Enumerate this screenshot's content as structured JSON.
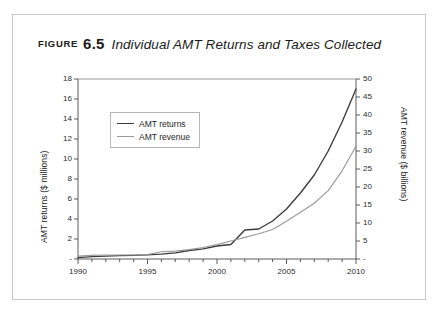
{
  "figure": {
    "kicker": "Figure",
    "number": "6.5",
    "title": "Individual AMT Returns and Taxes Collected"
  },
  "colors": {
    "returns_line": "#3b3b3b",
    "revenue_line": "#9a9a9a",
    "axis": "#4a4a4a",
    "frame": "#c9c9c9",
    "text": "#1b1b1b"
  },
  "legend": {
    "position": "top-left-inside",
    "items": [
      {
        "label": "AMT returns",
        "color": "#3b3b3b"
      },
      {
        "label": "AMT revenue",
        "color": "#9a9a9a"
      }
    ]
  },
  "chart_data": {
    "type": "line",
    "title": "Individual AMT Returns and Taxes Collected",
    "xlabel": "",
    "ylabel": "AMT returns ($ millions)",
    "y2label": "AMT revenue ($ billions)",
    "grid": false,
    "xlim": [
      1990,
      2010
    ],
    "ylim": [
      0,
      18
    ],
    "y2lim": [
      0,
      50
    ],
    "xticks": [
      1990,
      1995,
      2000,
      2005,
      2010
    ],
    "xticklabels": [
      "1990",
      "1995",
      "2000",
      "2005",
      "2010"
    ],
    "xminorticks_every": 1,
    "yticks": [
      0,
      2,
      4,
      6,
      8,
      10,
      12,
      14,
      16,
      18
    ],
    "yticklabels": [
      "-",
      "2",
      "4",
      "6",
      "8",
      "10",
      "12",
      "14",
      "16",
      "18"
    ],
    "y2ticks": [
      0,
      5,
      10,
      15,
      20,
      25,
      30,
      35,
      40,
      45,
      50
    ],
    "y2ticklabels": [
      "-",
      "5",
      "10",
      "15",
      "20",
      "25",
      "30",
      "35",
      "40",
      "45",
      "50"
    ],
    "x": [
      1990,
      1991,
      1992,
      1993,
      1994,
      1995,
      1996,
      1997,
      1998,
      1999,
      2000,
      2001,
      2002,
      2003,
      2004,
      2005,
      2006,
      2007,
      2008,
      2009,
      2010
    ],
    "series": [
      {
        "name": "AMT returns",
        "axis": "left",
        "unit": "$ millions",
        "color": "#3b3b3b",
        "values": [
          0.13,
          0.24,
          0.29,
          0.33,
          0.37,
          0.41,
          0.48,
          0.62,
          0.85,
          1.02,
          1.3,
          1.45,
          2.9,
          3.0,
          3.8,
          5.0,
          6.6,
          8.4,
          10.8,
          13.7,
          17.0
        ]
      },
      {
        "name": "AMT revenue",
        "axis": "right",
        "unit": "$ billions",
        "color": "#9a9a9a",
        "values": [
          0.8,
          1.0,
          1.1,
          1.1,
          1.1,
          1.2,
          2.0,
          2.2,
          2.6,
          3.2,
          4.0,
          5.0,
          6.0,
          7.0,
          8.2,
          10.5,
          13.0,
          15.5,
          19.0,
          24.5,
          31.3
        ]
      }
    ]
  }
}
